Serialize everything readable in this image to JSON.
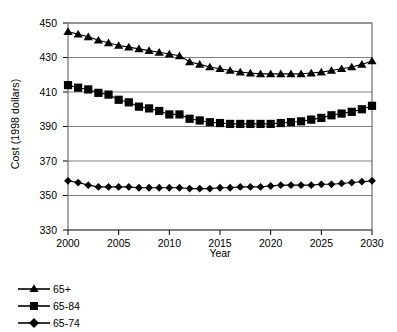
{
  "chart_data": {
    "type": "line",
    "title": "",
    "xlabel": "Year",
    "ylabel": "Cost (1998 dollars)",
    "xlim": [
      2000,
      2030
    ],
    "ylim": [
      330,
      450
    ],
    "xticks": [
      2000,
      2005,
      2010,
      2015,
      2020,
      2025,
      2030
    ],
    "yticks": [
      330,
      350,
      370,
      390,
      410,
      430,
      450
    ],
    "grid": "horizontal",
    "legend_position": "below-left",
    "x": [
      2000,
      2001,
      2002,
      2003,
      2004,
      2005,
      2006,
      2007,
      2008,
      2009,
      2010,
      2011,
      2012,
      2013,
      2014,
      2015,
      2016,
      2017,
      2018,
      2019,
      2020,
      2021,
      2022,
      2023,
      2024,
      2025,
      2026,
      2027,
      2028,
      2029,
      2030
    ],
    "series": [
      {
        "name": "65+",
        "marker": "triangle",
        "color": "#000000",
        "values": [
          445,
          443.5,
          442,
          440,
          438.5,
          437,
          436,
          435,
          434,
          433,
          432,
          431,
          427.5,
          426,
          424.5,
          423.5,
          422.5,
          421.5,
          421,
          420.5,
          420.5,
          420.5,
          420.5,
          420.5,
          421,
          421.5,
          422.5,
          423.5,
          424.5,
          426,
          428
        ]
      },
      {
        "name": "65-84",
        "marker": "square",
        "color": "#000000",
        "values": [
          414,
          412.5,
          411.5,
          409.5,
          408.5,
          405.5,
          404,
          401.5,
          400.5,
          399,
          397,
          397,
          394.5,
          393.5,
          392.5,
          392,
          391.5,
          391.5,
          391.5,
          391.5,
          391.5,
          392,
          392.5,
          393,
          394,
          395,
          396.5,
          397.5,
          398.5,
          400,
          402
        ]
      },
      {
        "name": "65-74",
        "marker": "diamond",
        "color": "#000000",
        "values": [
          358.5,
          357.5,
          356,
          355,
          355,
          355,
          355,
          354.5,
          354.5,
          354.5,
          354.5,
          354.5,
          354,
          354,
          354,
          354.5,
          354.5,
          355,
          355,
          355,
          355.5,
          356,
          356,
          356,
          356,
          356.5,
          356.5,
          357,
          357.5,
          358,
          358.5
        ]
      }
    ]
  },
  "axis": {
    "ylabel": "Cost (1998 dollars)",
    "xlabel": "Year"
  },
  "legend": {
    "items": [
      {
        "label": "65+"
      },
      {
        "label": "65-84"
      },
      {
        "label": "65-74"
      }
    ]
  }
}
